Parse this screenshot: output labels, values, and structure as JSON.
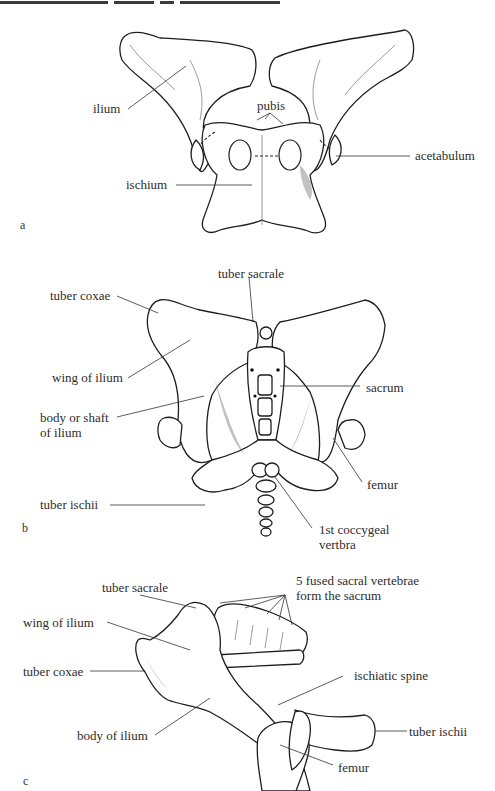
{
  "header": {
    "text_truncated": true
  },
  "figures": [
    {
      "id": "a",
      "panel_label": "a",
      "labels": {
        "ilium": "ilium",
        "pubis": "pubis",
        "acetabulum": "acetabulum",
        "ischium": "ischium"
      }
    },
    {
      "id": "b",
      "panel_label": "b",
      "labels": {
        "tuber_sacrale": "tuber sacrale",
        "tuber_coxae": "tuber coxae",
        "wing_of_ilium": "wing of ilium",
        "sacrum": "sacrum",
        "body_or_shaft_line1": "body or shaft",
        "body_or_shaft_line2": "of ilium",
        "femur": "femur",
        "tuber_ischii": "tuber ischii",
        "coccygeal_line1": "1st coccygeal",
        "coccygeal_line2": "vertbra"
      }
    },
    {
      "id": "c",
      "panel_label": "c",
      "labels": {
        "tuber_sacrale": "tuber sacrale",
        "fused_line1": "5 fused sacral vertebrae",
        "fused_line2": "form the sacrum",
        "wing_of_ilium": "wing of ilium",
        "tuber_coxae": "tuber coxae",
        "ischiatic_spine": "ischiatic spine",
        "body_of_ilium": "body of ilium",
        "tuber_ischii": "tuber ischii",
        "femur": "femur"
      }
    }
  ]
}
